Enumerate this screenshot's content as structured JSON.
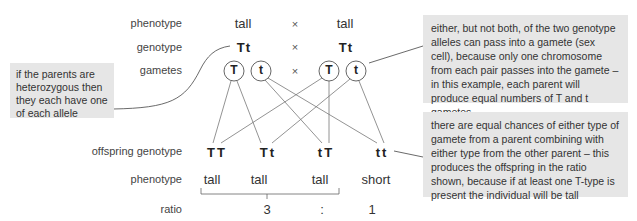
{
  "row_labels": {
    "phenotype_parent": "phenotype",
    "genotype": "genotype",
    "gametes": "gametes",
    "offspring_genotype": "offspring genotype",
    "phenotype_offspring": "phenotype",
    "ratio": "ratio"
  },
  "parents": {
    "parent1": {
      "phenotype": "tall",
      "genotype": "Tt",
      "gametes": [
        "T",
        "t"
      ]
    },
    "parent2": {
      "phenotype": "tall",
      "genotype": "Tt",
      "gametes": [
        "T",
        "t"
      ]
    },
    "cross_symbol": "×"
  },
  "offspring": [
    {
      "genotype": "TT",
      "phenotype": "tall"
    },
    {
      "genotype": "Tt",
      "phenotype": "tall"
    },
    {
      "genotype": "tT",
      "phenotype": "tall"
    },
    {
      "genotype": "tt",
      "phenotype": "short"
    }
  ],
  "ratio": {
    "dominant": "3",
    "separator": ":",
    "recessive": "1"
  },
  "callouts": {
    "heterozygous": "if the parents are heterozygous then they each have one of each allele",
    "gametes": "either, but not both, of the two genotype alleles can pass into a gamete (sex cell), because only one chromosome from each pair passes into the gamete – in this example, each parent will produce equal numbers of T and t gametes",
    "offspring": "there are equal chances of either type of gamete from a parent combining with either type from the other parent – this produces the offspring in the ratio shown, because if at least one T-type is present the individual will be tall"
  },
  "colors": {
    "callout_bg": "#e6e6e6",
    "line": "#555555",
    "text": "#333333"
  }
}
